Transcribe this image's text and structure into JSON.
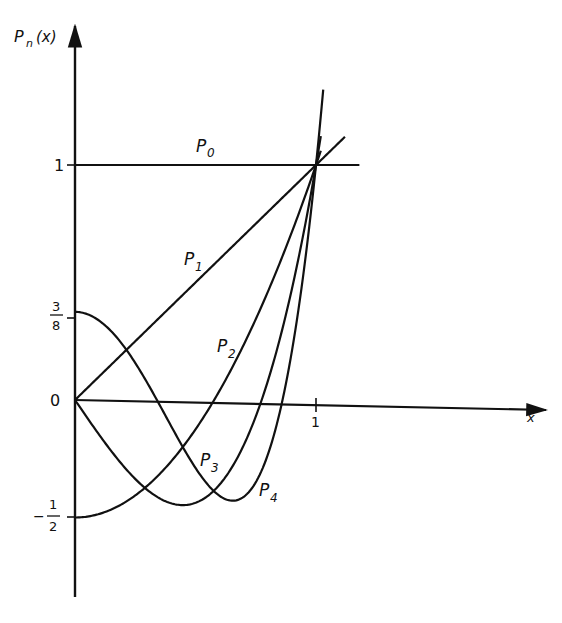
{
  "chart_data": {
    "type": "line",
    "title": "",
    "xlabel": "x",
    "ylabel": "P_n(x)",
    "ylabel_main": "P",
    "ylabel_sub": "n",
    "ylabel_rest": "(x)",
    "x_ticks": [
      {
        "value": 1,
        "label": "1"
      }
    ],
    "y_ticks": [
      {
        "value": 1,
        "label": "1"
      },
      {
        "value": 0.375,
        "label_num": "3",
        "label_den": "8"
      },
      {
        "value": 0,
        "label": "0"
      },
      {
        "value": -0.5,
        "label_sign": "−",
        "label_num": "1",
        "label_den": "2"
      }
    ],
    "xlim": [
      0,
      1.0
    ],
    "ylim": [
      -0.5,
      1
    ],
    "grid": false,
    "legend": "inline labels",
    "series": [
      {
        "name": "P0",
        "label_main": "P",
        "label_sub": "0",
        "formula": "1",
        "x_range": [
          0,
          1.18
        ]
      },
      {
        "name": "P1",
        "label_main": "P",
        "label_sub": "1",
        "formula": "x",
        "x_range": [
          0,
          1.12
        ]
      },
      {
        "name": "P2",
        "label_main": "P",
        "label_sub": "2",
        "formula": "(3x^2-1)/2",
        "x_range": [
          0,
          1.02
        ]
      },
      {
        "name": "P3",
        "label_main": "P",
        "label_sub": "3",
        "formula": "(5x^3-3x)/2",
        "x_range": [
          0,
          1.02
        ]
      },
      {
        "name": "P4",
        "label_main": "P",
        "label_sub": "4",
        "formula": "(35x^4-30x^2+3)/8",
        "x_range": [
          0,
          1.03
        ]
      }
    ],
    "key_points": {
      "P0_at_0": 1,
      "P1_at_0": 0,
      "P2_at_0": -0.5,
      "P3_at_0": 0,
      "P4_at_0": 0.375,
      "all_at_x1": 1,
      "P2_root": 0.577,
      "P3_root": 0.775,
      "P4_roots": [
        0.34,
        0.861
      ]
    }
  }
}
